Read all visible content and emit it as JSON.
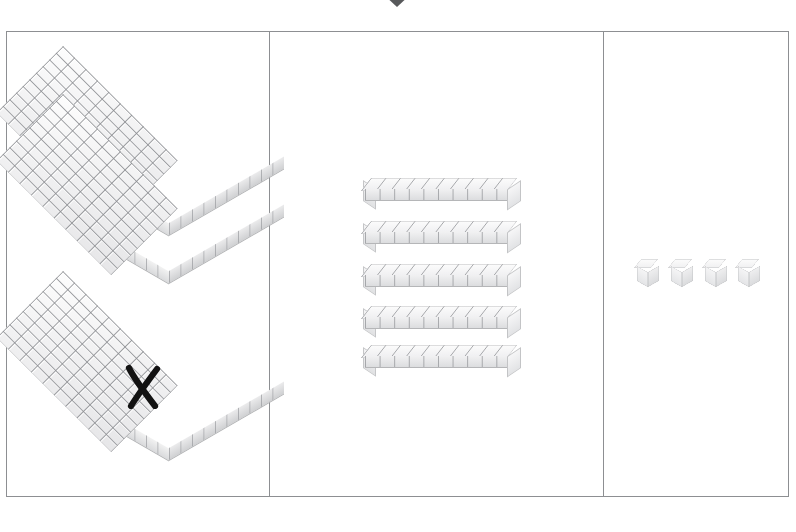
{
  "marker": {
    "name": "selection-caret",
    "shape": "down-triangle",
    "color": "#58595b",
    "position_x": 397
  },
  "frame": {
    "border_color": "#8d8f92",
    "background": "#ffffff",
    "columns": 3
  },
  "palette": {
    "block_light": "#fcfcfc",
    "block_mid": "#eeeef0",
    "block_shadow": "#dadbdd",
    "block_line": "#8c8e92",
    "cross_out": "#111111",
    "frame_line": "#8d8f92"
  },
  "columns": [
    {
      "id": "hundreds",
      "name": "hundreds-column",
      "label": "Hundreds",
      "block_type": "flat",
      "block_value": 100,
      "block_grid": "10 x 10",
      "count_shown": 3,
      "count_active": 2,
      "count_crossed_out": 1,
      "value": 200,
      "blocks": [
        {
          "name": "flat-block-1",
          "state": "active",
          "value": 100,
          "x": 22,
          "y": 45
        },
        {
          "name": "flat-block-2",
          "state": "active",
          "value": 100,
          "x": 22,
          "y": 93
        },
        {
          "name": "flat-block-3",
          "state": "crossed-out",
          "value": 100,
          "x": 22,
          "y": 270
        }
      ],
      "cross_out_mark": {
        "name": "x-mark",
        "glyph": "X",
        "x": 118,
        "y": 333
      }
    },
    {
      "id": "tens",
      "name": "tens-column",
      "label": "Tens",
      "block_type": "rod",
      "block_value": 10,
      "block_grid": "1 x 10",
      "count_shown": 5,
      "count_active": 5,
      "count_crossed_out": 0,
      "value": 50,
      "blocks": [
        {
          "name": "rod-block-1",
          "state": "active",
          "value": 10,
          "x": 94,
          "y": 146
        },
        {
          "name": "rod-block-2",
          "state": "active",
          "value": 10,
          "x": 94,
          "y": 189
        },
        {
          "name": "rod-block-3",
          "state": "active",
          "value": 10,
          "x": 94,
          "y": 232
        },
        {
          "name": "rod-block-4",
          "state": "active",
          "value": 10,
          "x": 94,
          "y": 274
        },
        {
          "name": "rod-block-5",
          "state": "active",
          "value": 10,
          "x": 94,
          "y": 313
        }
      ]
    },
    {
      "id": "ones",
      "name": "ones-column",
      "label": "Ones",
      "block_type": "unit-cube",
      "block_value": 1,
      "block_grid": "1 x 1",
      "count_shown": 4,
      "count_active": 4,
      "count_crossed_out": 0,
      "value": 4,
      "blocks": [
        {
          "name": "unit-block-1",
          "state": "active",
          "value": 1,
          "x": 33,
          "y": 227
        },
        {
          "name": "unit-block-2",
          "state": "active",
          "value": 1,
          "x": 67,
          "y": 227
        },
        {
          "name": "unit-block-3",
          "state": "active",
          "value": 1,
          "x": 101,
          "y": 227
        },
        {
          "name": "unit-block-4",
          "state": "active",
          "value": 1,
          "x": 134,
          "y": 227
        }
      ]
    }
  ],
  "totals": {
    "hundreds": 2,
    "tens": 5,
    "ones": 4,
    "represented_number": 254
  }
}
